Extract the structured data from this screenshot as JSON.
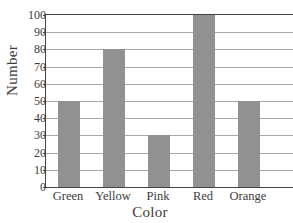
{
  "chart_data": {
    "type": "bar",
    "title": "",
    "xlabel": "Color",
    "ylabel": "Number",
    "categories": [
      "Green",
      "Yellow",
      "Pink",
      "Red",
      "Orange"
    ],
    "values": [
      50,
      80,
      30,
      100,
      50
    ],
    "ylim": [
      0,
      100
    ],
    "ytick_labels": [
      "0",
      "10",
      "20",
      "30",
      "40",
      "50",
      "60",
      "70",
      "80",
      "90",
      "100"
    ],
    "ytick_values": [
      0,
      10,
      20,
      30,
      40,
      50,
      60,
      70,
      80,
      90,
      100
    ],
    "grid": "horizontal",
    "legend": "none",
    "bar_color": "#919191",
    "gridline_color": "#a8a8a8",
    "axis_color": "#444444",
    "background_color": "#ffffff"
  },
  "axes": {
    "y_title": "Number",
    "x_title": "Color"
  }
}
